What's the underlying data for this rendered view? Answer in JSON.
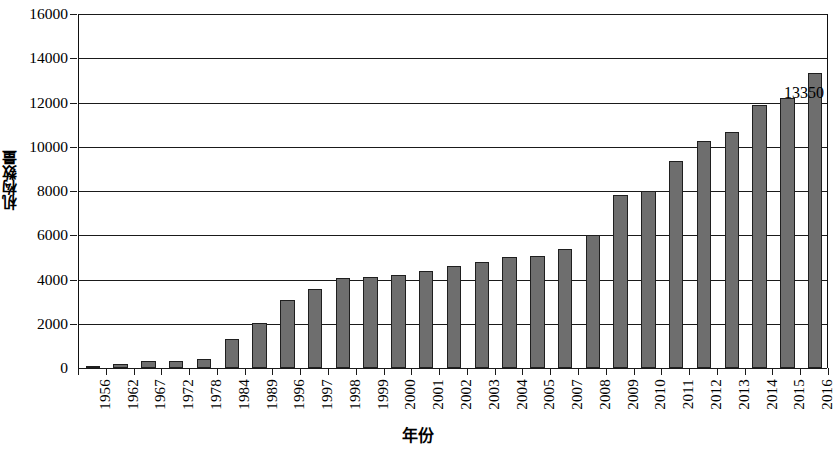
{
  "chart_data": {
    "type": "bar",
    "title": "",
    "subtitle": "",
    "xlabel": "年份",
    "ylabel": "机构数量",
    "ylim": [
      0,
      16000
    ],
    "ytick_step": 2000,
    "yticks": [
      "0",
      "2000",
      "4000",
      "6000",
      "8000",
      "10000",
      "12000",
      "14000",
      "16000"
    ],
    "grid": true,
    "legend": "none",
    "bar_color": "#6e6e6e",
    "bar_edge_color": "#1f1f1f",
    "axis_color": "#1a1a1a",
    "categories": [
      "1956",
      "1962",
      "1967",
      "1972",
      "1978",
      "1984",
      "1989",
      "1996",
      "1997",
      "1998",
      "1999",
      "2000",
      "2001",
      "2002",
      "2003",
      "2004",
      "2005",
      "2007",
      "2008",
      "2009",
      "2010",
      "2011",
      "2012",
      "2013",
      "2014",
      "2015",
      "2016"
    ],
    "values": [
      60,
      180,
      330,
      320,
      400,
      1300,
      2050,
      3080,
      3580,
      4080,
      4120,
      4220,
      4400,
      4600,
      4780,
      5000,
      5080,
      5400,
      6000,
      7820,
      8000,
      9350,
      10250,
      10650,
      11900,
      12200,
      13350
    ],
    "annotations": [
      {
        "label": "13350",
        "category": "2016",
        "value": 13350
      }
    ]
  }
}
